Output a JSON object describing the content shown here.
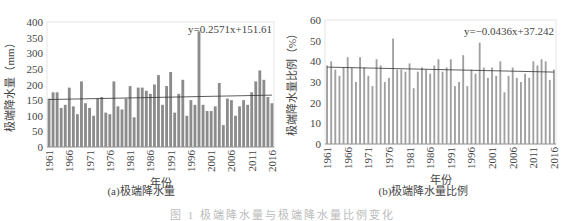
{
  "chart_data": [
    {
      "id": "a",
      "type": "bar",
      "title": "(a)极端降水量",
      "xlabel": "年份",
      "ylabel": "极端降水量（mm）",
      "ylim": [
        0,
        400
      ],
      "yticks": [
        0,
        50,
        100,
        150,
        200,
        250,
        300,
        350,
        400
      ],
      "xticks": [
        "1961",
        "1966",
        "1971",
        "1976",
        "1981",
        "1986",
        "1991",
        "1996",
        "2001",
        "2006",
        "2011",
        "2016"
      ],
      "grid": false,
      "trendline": {
        "equation": "y=0.2571x+151.61",
        "slope": 0.2571,
        "intercept": 151.61
      },
      "bar_color": "#8c8c8c",
      "categories": [
        1961,
        1962,
        1963,
        1964,
        1965,
        1966,
        1967,
        1968,
        1969,
        1970,
        1971,
        1972,
        1973,
        1974,
        1975,
        1976,
        1977,
        1978,
        1979,
        1980,
        1981,
        1982,
        1983,
        1984,
        1985,
        1986,
        1987,
        1988,
        1989,
        1990,
        1991,
        1992,
        1993,
        1994,
        1995,
        1996,
        1997,
        1998,
        1999,
        2000,
        2001,
        2002,
        2003,
        2004,
        2005,
        2006,
        2007,
        2008,
        2009,
        2010,
        2011,
        2012,
        2013,
        2014,
        2015,
        2016
      ],
      "values": [
        155,
        175,
        175,
        125,
        135,
        190,
        130,
        105,
        210,
        140,
        125,
        100,
        155,
        160,
        110,
        105,
        210,
        130,
        120,
        155,
        195,
        95,
        190,
        190,
        180,
        170,
        200,
        230,
        135,
        195,
        240,
        110,
        170,
        215,
        100,
        150,
        135,
        370,
        135,
        115,
        115,
        130,
        205,
        70,
        155,
        150,
        100,
        130,
        150,
        135,
        175,
        210,
        245,
        215,
        160,
        140
      ]
    },
    {
      "id": "b",
      "type": "bar",
      "title": "(b)极端降水量比例",
      "xlabel": "年份",
      "ylabel": "极端降水量比例（%）",
      "ylim": [
        0,
        60
      ],
      "yticks": [
        0,
        10,
        20,
        30,
        40,
        50,
        60
      ],
      "xticks": [
        "1961",
        "1966",
        "1971",
        "1976",
        "1981",
        "1986",
        "1991",
        "1996",
        "2001",
        "2006",
        "2011",
        "2016"
      ],
      "grid": false,
      "trendline": {
        "equation": "y=−0.0436x+37.242",
        "slope": -0.0436,
        "intercept": 37.242
      },
      "bar_color": "#a0a0a0",
      "categories": [
        1961,
        1962,
        1963,
        1964,
        1965,
        1966,
        1967,
        1968,
        1969,
        1970,
        1971,
        1972,
        1973,
        1974,
        1975,
        1976,
        1977,
        1978,
        1979,
        1980,
        1981,
        1982,
        1983,
        1984,
        1985,
        1986,
        1987,
        1988,
        1989,
        1990,
        1991,
        1992,
        1993,
        1994,
        1995,
        1996,
        1997,
        1998,
        1999,
        2000,
        2001,
        2002,
        2003,
        2004,
        2005,
        2006,
        2007,
        2008,
        2009,
        2010,
        2011,
        2012,
        2013,
        2014,
        2015,
        2016
      ],
      "values": [
        38,
        40,
        36,
        33,
        37,
        42,
        37,
        30,
        42,
        37,
        33,
        28,
        41,
        38,
        30,
        32,
        51,
        36,
        36,
        35,
        39,
        27,
        35,
        37,
        36,
        34,
        38,
        41,
        35,
        37,
        41,
        28,
        30,
        43,
        28,
        36,
        34,
        49,
        37,
        32,
        37,
        33,
        40,
        25,
        33,
        37,
        32,
        30,
        34,
        32,
        40,
        38,
        41,
        40,
        31,
        36
      ]
    }
  ],
  "figure_caption": "图 1  极端降水量与极端降水量比例变化"
}
